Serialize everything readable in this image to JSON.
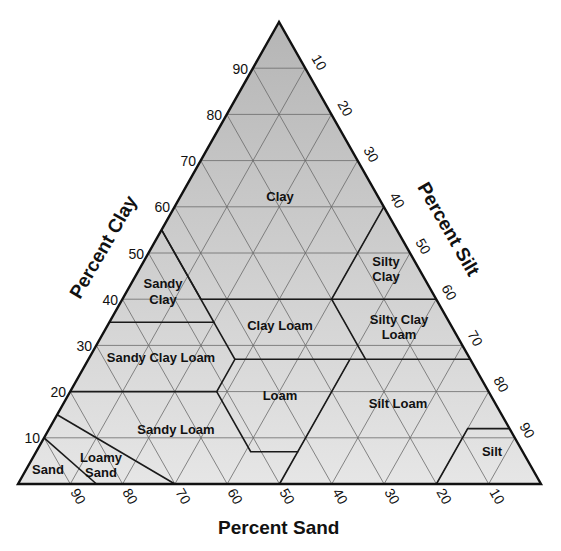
{
  "axes": {
    "clay": {
      "title": "Percent Clay",
      "ticks": [
        "10",
        "20",
        "30",
        "40",
        "50",
        "60",
        "70",
        "80",
        "90"
      ]
    },
    "silt": {
      "title": "Percent Silt",
      "ticks": [
        "10",
        "20",
        "30",
        "40",
        "50",
        "60",
        "70",
        "80",
        "90"
      ]
    },
    "sand": {
      "title": "Percent Sand",
      "ticks": [
        "90",
        "80",
        "70",
        "60",
        "50",
        "40",
        "30",
        "20",
        "10"
      ]
    }
  },
  "regions": {
    "clay": {
      "line1": "Clay"
    },
    "silty_clay": {
      "line1": "Silty",
      "line2": "Clay"
    },
    "sandy_clay": {
      "line1": "Sandy",
      "line2": "Clay"
    },
    "clay_loam": {
      "line1": "Clay Loam"
    },
    "silty_clay_loam": {
      "line1": "Silty Clay",
      "line2": "Loam"
    },
    "sandy_clay_loam": {
      "line1": "Sandy Clay Loam"
    },
    "loam": {
      "line1": "Loam"
    },
    "silt_loam": {
      "line1": "Silt Loam"
    },
    "sandy_loam": {
      "line1": "Sandy Loam"
    },
    "loamy_sand": {
      "line1": "Loamy",
      "line2": "Sand"
    },
    "sand": {
      "line1": "Sand"
    },
    "silt": {
      "line1": "Silt"
    }
  },
  "colors": {
    "fill_top": "#b9b9b9",
    "fill_bottom": "#e4e4e4",
    "grid": "#6a6a6a",
    "boundary": "#1a1a1a"
  }
}
